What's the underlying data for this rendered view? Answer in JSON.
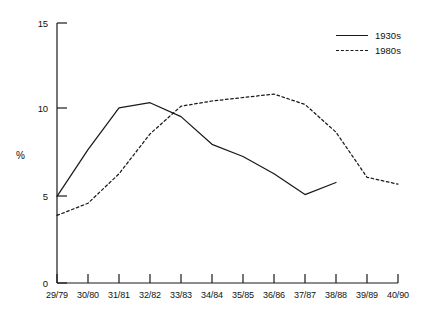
{
  "chart_data": {
    "type": "line",
    "title": "",
    "subtitle": "",
    "xlabel": "",
    "ylabel": "%",
    "categories": [
      "29/79",
      "30/80",
      "31/81",
      "32/82",
      "33/83",
      "34/84",
      "35/85",
      "36/86",
      "37/87",
      "38/88",
      "39/89",
      "40/90"
    ],
    "x": [
      "29/79",
      "30/80",
      "31/81",
      "32/82",
      "33/83",
      "34/84",
      "35/85",
      "36/86",
      "37/87",
      "38/88",
      "39/89",
      "40/90"
    ],
    "series": [
      {
        "name": "1930s",
        "style": "solid",
        "color": "#1a1a1a",
        "values": [
          5.0,
          7.7,
          10.1,
          10.4,
          9.6,
          8.0,
          7.3,
          6.3,
          5.1,
          5.8,
          null,
          null
        ]
      },
      {
        "name": "1980s",
        "style": "dashed",
        "color": "#1a1a1a",
        "values": [
          3.9,
          4.6,
          6.3,
          8.6,
          10.2,
          10.5,
          10.7,
          10.9,
          10.3,
          8.7,
          6.1,
          5.7
        ]
      }
    ],
    "ylim": [
      0,
      15
    ],
    "yticks": [
      0,
      5,
      10,
      15
    ],
    "ytick_labels": [
      "0",
      "5",
      "10",
      "15"
    ],
    "xtick_labels": [
      "29/79",
      "30/80",
      "31/81",
      "32/82",
      "33/83",
      "34/84",
      "35/85",
      "36/86",
      "37/87",
      "38/88",
      "39/89",
      "40/90"
    ],
    "grid": false,
    "legend_position": "top-right",
    "legend_entries": [
      "1930s",
      "1980s"
    ]
  },
  "axes": {
    "y_label": "%",
    "y_ticks": [
      {
        "value": 15,
        "label": "15"
      },
      {
        "value": 10,
        "label": "10"
      },
      {
        "value": 5,
        "label": "5"
      },
      {
        "value": 0,
        "label": "0"
      }
    ],
    "x_ticks": [
      {
        "label": "29/79"
      },
      {
        "label": "30/80"
      },
      {
        "label": "31/81"
      },
      {
        "label": "32/82"
      },
      {
        "label": "33/83"
      },
      {
        "label": "34/84"
      },
      {
        "label": "35/85"
      },
      {
        "label": "36/86"
      },
      {
        "label": "37/87"
      },
      {
        "label": "38/88"
      },
      {
        "label": "39/89"
      },
      {
        "label": "40/90"
      }
    ]
  },
  "legend": {
    "items": [
      {
        "label": "1930s",
        "style": "solid"
      },
      {
        "label": "1980s",
        "style": "dashed"
      }
    ]
  },
  "colors": {
    "line": "#1a1a1a",
    "axis": "#1a1a1a",
    "background": "#ffffff"
  }
}
